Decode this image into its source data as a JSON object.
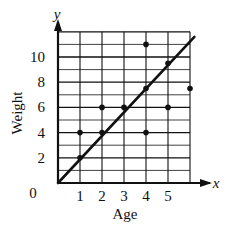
{
  "chart_data": {
    "type": "scatter",
    "title": "",
    "xlabel": "Age",
    "ylabel": "Weight",
    "x_axis_var": "x",
    "y_axis_var": "y",
    "origin_label": "0",
    "xlim": [
      0,
      6
    ],
    "ylim": [
      0,
      12
    ],
    "x_ticks": [
      1,
      2,
      3,
      4,
      5
    ],
    "y_ticks": [
      2,
      4,
      6,
      8,
      10
    ],
    "grid": true,
    "grid_x_step": 1,
    "grid_y_step": 1,
    "points": [
      {
        "x": 1,
        "y": 4
      },
      {
        "x": 1,
        "y": 2
      },
      {
        "x": 2,
        "y": 6
      },
      {
        "x": 2,
        "y": 4
      },
      {
        "x": 3,
        "y": 6
      },
      {
        "x": 4,
        "y": 11
      },
      {
        "x": 4,
        "y": 7.5
      },
      {
        "x": 4,
        "y": 4
      },
      {
        "x": 5,
        "y": 9.5
      },
      {
        "x": 5,
        "y": 6
      },
      {
        "x": 6,
        "y": 7.5
      }
    ],
    "trend_line": {
      "x0": 0,
      "y0": 0,
      "x1": 6.2,
      "y1": 11.6,
      "slope": 1.9
    },
    "colors": {
      "ink": "#111111",
      "background": "#ffffff"
    }
  }
}
